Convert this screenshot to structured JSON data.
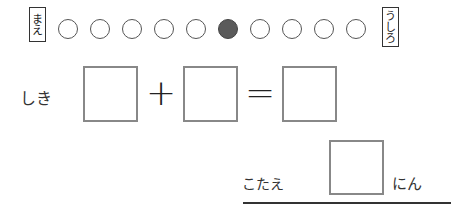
{
  "queue": {
    "front_label": [
      "ま",
      "え"
    ],
    "back_label": [
      "う",
      "し",
      "ろ"
    ],
    "circles": [
      {
        "filled": false
      },
      {
        "filled": false
      },
      {
        "filled": false
      },
      {
        "filled": false
      },
      {
        "filled": false
      },
      {
        "filled": true
      },
      {
        "filled": false
      },
      {
        "filled": false
      },
      {
        "filled": false
      },
      {
        "filled": false
      }
    ]
  },
  "equation": {
    "label": "しき",
    "plus": "+",
    "equals": "="
  },
  "answer": {
    "label": "こたえ",
    "unit": "にん"
  },
  "colors": {
    "filled_circle": "#5a5a5a",
    "box_border": "#888888"
  }
}
